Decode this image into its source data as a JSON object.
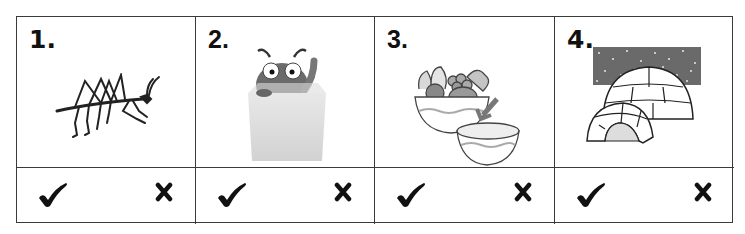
{
  "worksheet": {
    "items": [
      {
        "number": "1.",
        "picture": "stick-insect",
        "answers": {
          "yes": "check-mark",
          "no": "cross-mark"
        }
      },
      {
        "number": "2.",
        "picture": "bug-in-box",
        "answers": {
          "yes": "check-mark",
          "no": "cross-mark"
        }
      },
      {
        "number": "3.",
        "picture": "fruit-bowls-with-arrow",
        "answers": {
          "yes": "check-mark",
          "no": "cross-mark"
        }
      },
      {
        "number": "4.",
        "picture": "igloo-at-night",
        "answers": {
          "yes": "check-mark",
          "no": "cross-mark"
        }
      }
    ]
  },
  "colors": {
    "line": "#3a3a3a",
    "ink": "#111111",
    "night_sky": "#6a6a6a"
  }
}
